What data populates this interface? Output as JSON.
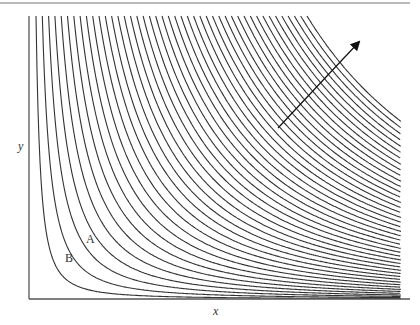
{
  "figure": {
    "type": "indifference-curve map",
    "axes": {
      "x_label": "x",
      "y_label": "y",
      "origin_px": [
        29,
        299
      ],
      "x_end_px": 410,
      "y_top_px": 16
    },
    "top_rule": {
      "y_px": 3,
      "x_start_px": 0,
      "x_end_px": 410
    },
    "curves": {
      "count": 44,
      "first_top_x_px": 36,
      "last_top_x_px": 307,
      "top_y_px": 16,
      "right_edge_x_px": 401,
      "exponent": 1.6,
      "stroke": "#333333"
    },
    "labels": [
      {
        "text": "A",
        "x_px": 86,
        "y_px": 233,
        "name": "curve-label-a"
      },
      {
        "text": "B",
        "x_px": 65,
        "y_px": 252,
        "name": "curve-label-b"
      }
    ],
    "arrow": {
      "from_px": [
        278,
        128
      ],
      "to_px": [
        359,
        42
      ],
      "meaning": "direction of increasing utility",
      "color": "#111111"
    },
    "colors": {
      "axis": "#555555",
      "curve": "#333333",
      "rule": "#777777"
    }
  }
}
